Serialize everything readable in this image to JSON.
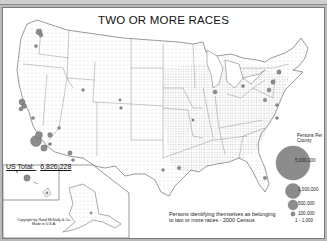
{
  "map": {
    "title": "TWO OR MORE RACES",
    "us_total_label": "US Total:",
    "us_total_value": "6,826,228",
    "copyright_line1": "Copyright by Rand McNally & Co.",
    "copyright_line2": "Made in U.S.A.",
    "description": "Persons identifying themselves as belonging to two or more races - 2000 Census",
    "legend": {
      "title_line1": "Persons Per",
      "title_line2": "County",
      "entries": [
        {
          "label": "5,000,000",
          "symbol": "large-circle"
        },
        {
          "label": "1,000,000",
          "symbol": "medium-circle"
        },
        {
          "label": "500,000",
          "symbol": "small-circle"
        },
        {
          "label": "100,000",
          "symbol": "tiny-circle"
        },
        {
          "label": "1 - 1,000",
          "symbol": "dot"
        }
      ]
    },
    "colors": {
      "circle_fill": "#8c8c8c",
      "border": "#7a7a7a",
      "background": "#b9b9b9"
    }
  }
}
